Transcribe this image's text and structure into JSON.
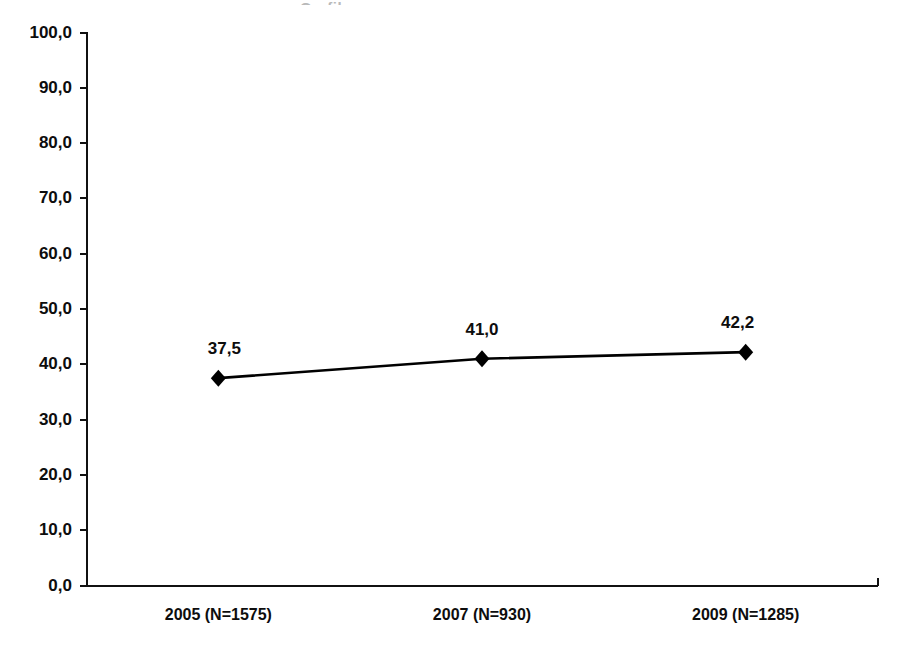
{
  "chart_data": {
    "type": "line",
    "title": "",
    "subtitle": "",
    "xlabel": "",
    "ylabel": "",
    "categories": [
      "2005 (N=1575)",
      "2007 (N=930)",
      "2009 (N=1285)"
    ],
    "values": [
      37.5,
      41.0,
      42.2
    ],
    "point_labels": [
      "37,5",
      "41,0",
      "42,2"
    ],
    "series": [
      {
        "name": "",
        "values": [
          37.5,
          41.0,
          42.2
        ],
        "marker": "diamond",
        "color": "#000000"
      }
    ],
    "ylim": [
      0,
      100
    ],
    "ytick_step": 10,
    "ytick_labels": [
      "100,0",
      "90,0",
      "80,0",
      "70,0",
      "60,0",
      "50,0",
      "40,0",
      "30,0",
      "20,0",
      "10,0",
      "0,0"
    ],
    "ytick_values": [
      100,
      90,
      80,
      70,
      60,
      50,
      40,
      30,
      20,
      10,
      0
    ],
    "decimal_separator": ",",
    "grid": false,
    "legend": false,
    "legend_position": "none"
  },
  "artifact": {
    "clipped_title_text": "Grafik"
  }
}
